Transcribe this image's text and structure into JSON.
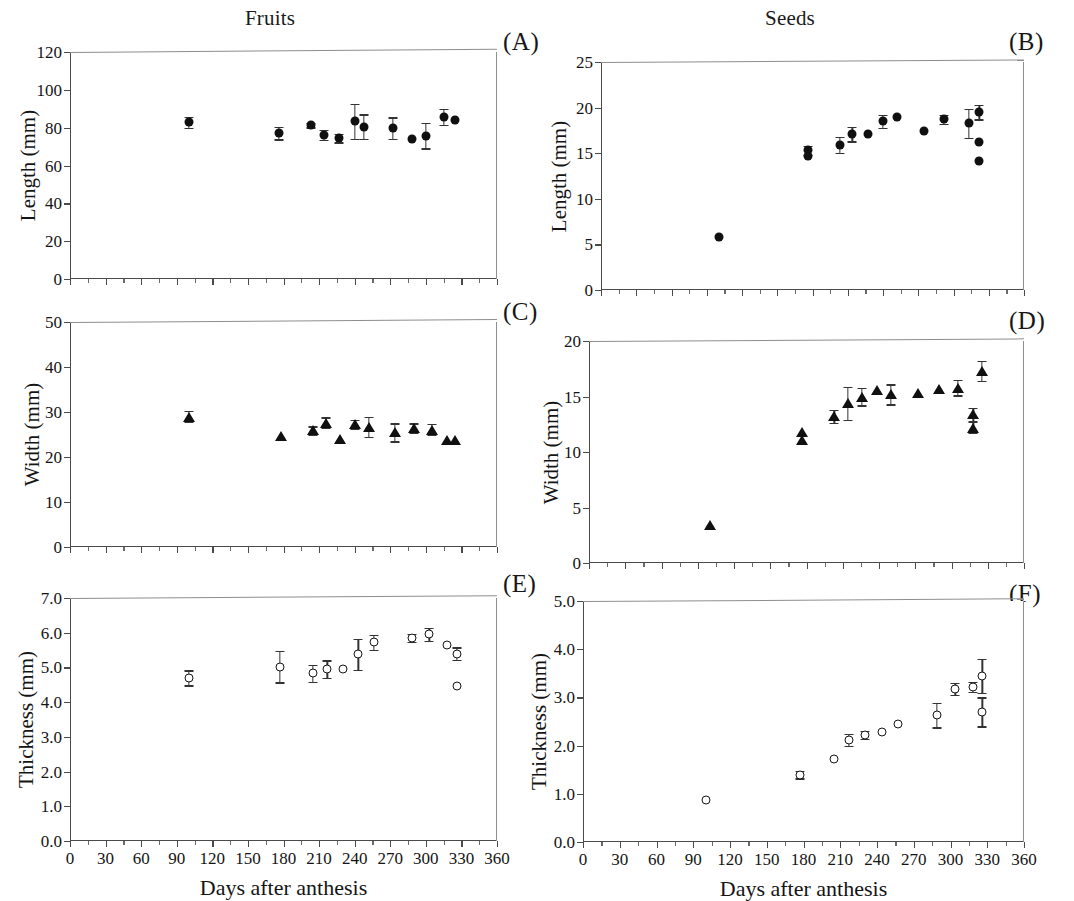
{
  "figure": {
    "column_titles": [
      "Fruits",
      "Seeds"
    ],
    "x_axis_title": "Days after anthesis",
    "panel_letters": [
      "(A)",
      "(B)",
      "(C)",
      "(D)",
      "(E)",
      "(F)"
    ]
  },
  "chart_data": [
    {
      "type": "scatter",
      "panel": "(A)",
      "title": "Fruits",
      "xlabel": "Days after anthesis",
      "ylabel": "Length (mm)",
      "xlim": [
        0,
        360
      ],
      "ylim": [
        0,
        120
      ],
      "xticks": [
        0,
        30,
        60,
        90,
        120,
        150,
        180,
        210,
        240,
        270,
        300,
        330,
        360
      ],
      "yticks": [
        0,
        20,
        40,
        60,
        80,
        100,
        120
      ],
      "xticklabels": [
        "",
        "",
        "",
        "",
        "",
        "",
        "",
        "",
        "",
        "",
        "",
        "",
        ""
      ],
      "yticklabels": [
        "0",
        "20",
        "40",
        "60",
        "80",
        "100",
        "120"
      ],
      "grid": false,
      "legend": "none",
      "marker": "filled-circle",
      "errorbars": true,
      "x": [
        100,
        176,
        203,
        214,
        227,
        240,
        248,
        272,
        288,
        300,
        315,
        325
      ],
      "y": [
        82.8,
        77.2,
        81.3,
        76.3,
        74.4,
        83.4,
        80.6,
        79.8,
        73.8,
        75.8,
        85.6,
        84.0
      ],
      "yerr": [
        2.8,
        3.4,
        1.1,
        2.6,
        2.2,
        9.2,
        6.5,
        5.6,
        0.0,
        6.8,
        4.2,
        0.0
      ]
    },
    {
      "type": "scatter",
      "panel": "(B)",
      "title": "Seeds",
      "xlabel": "Days after anthesis",
      "ylabel": "Length (mm)",
      "xlim": [
        0,
        360
      ],
      "ylim": [
        0,
        25
      ],
      "xticks": [
        0,
        30,
        60,
        90,
        120,
        150,
        180,
        210,
        240,
        270,
        300,
        330,
        360
      ],
      "yticks": [
        0,
        5,
        10,
        15,
        20,
        25
      ],
      "yticklabels": [
        "0",
        "5",
        "10",
        "15",
        "20",
        "25"
      ],
      "grid": false,
      "legend": "none",
      "marker": "filled-circle",
      "errorbars": true,
      "x": [
        100,
        176,
        176,
        203,
        214,
        227,
        240,
        252,
        275,
        292,
        313,
        322,
        322,
        322
      ],
      "y": [
        5.8,
        15.3,
        14.7,
        15.9,
        17.1,
        17.1,
        18.5,
        19.0,
        17.4,
        18.7,
        18.3,
        19.5,
        16.2,
        14.1
      ],
      "yerr": [
        0.0,
        0.5,
        0.0,
        0.9,
        0.8,
        0.0,
        0.7,
        0.0,
        0.0,
        0.5,
        1.6,
        0.8,
        0.0,
        0.0
      ]
    },
    {
      "type": "scatter",
      "panel": "(C)",
      "title": "Fruits",
      "xlabel": "Days after anthesis",
      "ylabel": "Width (mm)",
      "xlim": [
        0,
        360
      ],
      "ylim": [
        0,
        50
      ],
      "xticks": [
        0,
        30,
        60,
        90,
        120,
        150,
        180,
        210,
        240,
        270,
        300,
        330,
        360
      ],
      "yticks": [
        0,
        10,
        20,
        30,
        40,
        50
      ],
      "yticklabels": [
        "0",
        "10",
        "20",
        "30",
        "40",
        "50"
      ],
      "grid": false,
      "legend": "none",
      "marker": "triangle",
      "errorbars": true,
      "x": [
        100,
        178,
        205,
        216,
        228,
        240,
        252,
        274,
        290,
        305,
        318,
        325
      ],
      "y": [
        29.0,
        24.7,
        25.9,
        27.6,
        24.0,
        27.3,
        26.7,
        25.5,
        26.5,
        26.1,
        23.8,
        23.8
      ],
      "yerr": [
        1.2,
        0.0,
        0.9,
        1.2,
        0.0,
        1.0,
        2.3,
        2.0,
        1.0,
        1.2,
        0.0,
        0.0
      ]
    },
    {
      "type": "scatter",
      "panel": "(D)",
      "title": "Seeds",
      "xlabel": "Days after anthesis",
      "ylabel": "Width (mm)",
      "xlim": [
        0,
        360
      ],
      "ylim": [
        0,
        20
      ],
      "xticks": [
        0,
        30,
        60,
        90,
        120,
        150,
        180,
        210,
        240,
        270,
        300,
        330,
        360
      ],
      "yticks": [
        0,
        5,
        10,
        15,
        20
      ],
      "yticklabels": [
        "0",
        "5",
        "10",
        "15",
        "20"
      ],
      "grid": false,
      "legend": "none",
      "marker": "triangle",
      "errorbars": true,
      "x": [
        100,
        176,
        176,
        203,
        214,
        226,
        238,
        250,
        272,
        290,
        305,
        318,
        318,
        325
      ],
      "y": [
        3.4,
        11.8,
        11.1,
        13.2,
        14.4,
        15.0,
        15.6,
        15.2,
        15.3,
        15.7,
        15.8,
        13.4,
        12.2,
        17.3
      ],
      "yerr": [
        0.0,
        0.0,
        0.0,
        0.6,
        1.5,
        0.8,
        0.0,
        0.9,
        0.0,
        0.0,
        0.7,
        0.6,
        0.5,
        0.9
      ]
    },
    {
      "type": "scatter",
      "panel": "(E)",
      "title": "Fruits",
      "xlabel": "Days after anthesis",
      "ylabel": "Thickness (mm)",
      "xlim": [
        0,
        360
      ],
      "ylim": [
        0.0,
        7.0
      ],
      "xticks": [
        0,
        30,
        60,
        90,
        120,
        150,
        180,
        210,
        240,
        270,
        300,
        330,
        360
      ],
      "yticks": [
        0.0,
        1.0,
        2.0,
        3.0,
        4.0,
        5.0,
        6.0,
        7.0
      ],
      "xticklabels": [
        "0",
        "30",
        "60",
        "90",
        "120",
        "150",
        "180",
        "210",
        "240",
        "270",
        "300",
        "330",
        "360"
      ],
      "yticklabels": [
        "0.0",
        "1.0",
        "2.0",
        "3.0",
        "4.0",
        "5.0",
        "6.0",
        "7.0"
      ],
      "grid": false,
      "legend": "none",
      "marker": "open-circle",
      "errorbars": true,
      "x": [
        100,
        177,
        205,
        217,
        230,
        243,
        256,
        288,
        303,
        318,
        326,
        326
      ],
      "y": [
        4.7,
        5.02,
        4.83,
        4.95,
        4.95,
        5.38,
        5.72,
        5.85,
        5.95,
        5.65,
        5.4,
        4.47
      ],
      "yerr": [
        0.22,
        0.45,
        0.25,
        0.25,
        0.0,
        0.45,
        0.22,
        0.12,
        0.18,
        0.0,
        0.18,
        0.0
      ]
    },
    {
      "type": "scatter",
      "panel": "(F)",
      "title": "Seeds",
      "xlabel": "Days after anthesis",
      "ylabel": "Thickness (mm)",
      "xlim": [
        0,
        360
      ],
      "ylim": [
        0.0,
        5.0
      ],
      "xticks": [
        0,
        30,
        60,
        90,
        120,
        150,
        180,
        210,
        240,
        270,
        300,
        330,
        360
      ],
      "yticks": [
        0.0,
        1.0,
        2.0,
        3.0,
        4.0,
        5.0
      ],
      "xticklabels": [
        "0",
        "30",
        "60",
        "90",
        "120",
        "150",
        "180",
        "210",
        "240",
        "270",
        "300",
        "330",
        "360"
      ],
      "yticklabels": [
        "0.0",
        "1.0",
        "2.0",
        "3.0",
        "4.0",
        "5.0"
      ],
      "grid": false,
      "legend": "none",
      "marker": "open-circle",
      "errorbars": true,
      "x": [
        100,
        177,
        205,
        217,
        230,
        244,
        257,
        289,
        304,
        318,
        326,
        326
      ],
      "y": [
        0.88,
        1.4,
        1.72,
        2.12,
        2.22,
        2.28,
        2.45,
        2.63,
        3.18,
        3.22,
        3.45,
        2.7
      ],
      "yerr": [
        0.0,
        0.08,
        0.0,
        0.12,
        0.08,
        0.0,
        0.0,
        0.25,
        0.12,
        0.1,
        0.35,
        0.3
      ]
    }
  ]
}
